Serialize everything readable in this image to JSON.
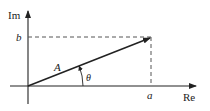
{
  "diagram": {
    "axes": {
      "vertical_label": "Im",
      "horizontal_label": "Re"
    },
    "labels": {
      "imag_component": "b",
      "real_component": "a",
      "magnitude": "A",
      "angle": "θ"
    },
    "colors": {
      "line": "#222222",
      "dashed": "#555555",
      "background": "#ffffff"
    }
  }
}
